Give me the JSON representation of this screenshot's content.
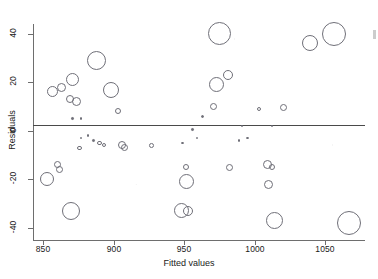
{
  "chart_data": {
    "type": "scatter",
    "title": "",
    "subtitle": "",
    "xlabel": "Fitted values",
    "ylabel": "Residuals",
    "xlim": [
      843,
      1078
    ],
    "ylim": [
      -45,
      44
    ],
    "xticks": [
      850,
      900,
      950,
      1000,
      1050
    ],
    "yticks": [
      40,
      20,
      0,
      -20,
      -40
    ],
    "xtick_labels": [
      "850",
      "900",
      "950",
      "1000",
      "1050"
    ],
    "ytick_labels": [
      "40",
      "20",
      "0",
      "-20",
      "-40"
    ],
    "grid": false,
    "legend": null,
    "legend_position": "none",
    "annotations": [
      {
        "type": "hline",
        "y": 0,
        "label": "zero residual reference line"
      }
    ],
    "marker": "open-circle",
    "size_encodes": "bubble radius proportional to weight / leverage",
    "point_count": 62,
    "series": [
      {
        "name": "Residuals vs fitted values",
        "points": [
          {
            "x": 857,
            "y": 16,
            "r": 5.5
          },
          {
            "x": 863,
            "y": 18,
            "r": 4.5
          },
          {
            "x": 871,
            "y": 21,
            "r": 6.5
          },
          {
            "x": 869,
            "y": 13,
            "r": 4.0
          },
          {
            "x": 874,
            "y": 12,
            "r": 4.5
          },
          {
            "x": 888,
            "y": 29,
            "r": 9.5
          },
          {
            "x": 898,
            "y": 17,
            "r": 8.0
          },
          {
            "x": 903,
            "y": 8,
            "r": 3.0
          },
          {
            "x": 871,
            "y": 5,
            "r": 1.2
          },
          {
            "x": 877,
            "y": 5,
            "r": 1.4
          },
          {
            "x": 956,
            "y": 0.5,
            "r": 1.2
          },
          {
            "x": 975,
            "y": 40,
            "r": 11.5
          },
          {
            "x": 1039,
            "y": 36,
            "r": 8.0
          },
          {
            "x": 1056,
            "y": 40,
            "r": 12.0
          },
          {
            "x": 973,
            "y": 19,
            "r": 7.5
          },
          {
            "x": 981,
            "y": 23,
            "r": 5.0
          },
          {
            "x": 971,
            "y": 10,
            "r": 3.5
          },
          {
            "x": 1003,
            "y": 9,
            "r": 2.0
          },
          {
            "x": 1020,
            "y": 9.5,
            "r": 3.5
          },
          {
            "x": 963,
            "y": 6,
            "r": 1.6
          },
          {
            "x": 991,
            "y": 2,
            "r": 1.1
          },
          {
            "x": 1012,
            "y": 2,
            "r": 1.1
          },
          {
            "x": 877,
            "y": -3,
            "r": 1.3
          },
          {
            "x": 882,
            "y": -2,
            "r": 1.2
          },
          {
            "x": 886,
            "y": -4,
            "r": 1.3
          },
          {
            "x": 890,
            "y": -5,
            "r": 2.2
          },
          {
            "x": 893,
            "y": -6,
            "r": 2.0
          },
          {
            "x": 876,
            "y": -7,
            "r": 2.2
          },
          {
            "x": 906,
            "y": -6,
            "r": 4.0
          },
          {
            "x": 908,
            "y": -7,
            "r": 3.5
          },
          {
            "x": 927,
            "y": -6,
            "r": 2.4
          },
          {
            "x": 949,
            "y": -5,
            "r": 1.4
          },
          {
            "x": 959,
            "y": -3,
            "r": 1.2
          },
          {
            "x": 995,
            "y": -3,
            "r": 1.4
          },
          {
            "x": 989,
            "y": -4,
            "r": 1.1
          },
          {
            "x": 860,
            "y": -14,
            "r": 3.5
          },
          {
            "x": 862,
            "y": -16,
            "r": 3.5
          },
          {
            "x": 853,
            "y": -20,
            "r": 7.0
          },
          {
            "x": 951,
            "y": -15,
            "r": 3.0
          },
          {
            "x": 952,
            "y": -21,
            "r": 7.5
          },
          {
            "x": 982,
            "y": -15,
            "r": 3.5
          },
          {
            "x": 1009,
            "y": -14,
            "r": 4.5
          },
          {
            "x": 1012,
            "y": -15,
            "r": 3.0
          },
          {
            "x": 1010,
            "y": -22,
            "r": 4.5
          },
          {
            "x": 870,
            "y": -33,
            "r": 9.0
          },
          {
            "x": 948,
            "y": -33,
            "r": 7.5
          },
          {
            "x": 953,
            "y": -33,
            "r": 5.0
          },
          {
            "x": 1014,
            "y": -37,
            "r": 8.5
          },
          {
            "x": 1067,
            "y": -38,
            "r": 12.0
          }
        ]
      }
    ]
  },
  "axes": {
    "x_title": "Fitted values",
    "y_title": "Residuals"
  }
}
